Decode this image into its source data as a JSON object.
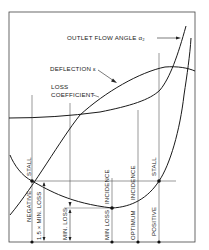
{
  "diagram": {
    "type": "cascade performance characteristic",
    "curves": {
      "outlet_flow_angle": "OUTLET FLOW ANGLE α₂",
      "deflection": "DEFLECTION ε",
      "loss_coefficient_line1": "LOSS",
      "loss_coefficient_line2": "COEFFICIENT"
    },
    "vertical_labels": {
      "negative": "NEGATIVE",
      "stall_left": "STALL",
      "one_five_min_loss": "1.5 × MIN. LOSS",
      "min_loss_dim": "MIN. LOSS",
      "min_loss_incidence_1": "MIN LOSS",
      "min_loss_incidence_2": "INCIDENCE",
      "optimum_1": "OPTIMUM",
      "optimum_2": "INCIDENCE",
      "positive": "POSITIVE",
      "stall_right": "STALL"
    },
    "markers": [
      "negative stall",
      "min loss incidence",
      "optimum incidence",
      "positive stall"
    ],
    "colors": {
      "line": "#1a1a1a",
      "frame": "#333333",
      "background": "#ffffff"
    }
  }
}
